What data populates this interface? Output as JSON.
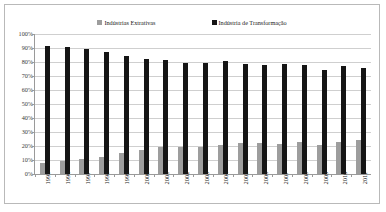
{
  "chart_data": {
    "type": "bar",
    "title": "",
    "subtitle": "",
    "xlabel": "",
    "ylabel": "",
    "ylim": [
      0,
      100
    ],
    "ytick_labels": [
      "100%",
      "90%",
      "80%",
      "70%",
      "60%",
      "50%",
      "40%",
      "30%",
      "20%",
      "10%",
      "0%"
    ],
    "ytick_values": [
      100,
      90,
      80,
      70,
      60,
      50,
      40,
      30,
      20,
      10,
      0
    ],
    "grid": true,
    "legend_position": "top",
    "categories": [
      "1995",
      "1996",
      "1997",
      "1998",
      "1999",
      "2000",
      "2001",
      "2002",
      "2003",
      "2004",
      "2005",
      "2006",
      "2007",
      "2008",
      "2009",
      "2010",
      "2011"
    ],
    "series": [
      {
        "name": "Indústrias Extrativas",
        "color": "#9d9d9d",
        "values": [
          8,
          9.5,
          11,
          12,
          15,
          17.5,
          19,
          19.5,
          19,
          21,
          22,
          22.5,
          21.5,
          23,
          21,
          23,
          24
        ]
      },
      {
        "name": "Indústria de Transformação",
        "color": "#151515",
        "values": [
          91.5,
          90.5,
          89,
          87,
          84.5,
          82.5,
          81.5,
          79.5,
          79.5,
          80.5,
          78.5,
          78,
          78.5,
          78,
          74.5,
          77,
          76
        ]
      }
    ]
  },
  "legend": {
    "entries": [
      {
        "label": "Indústrias Extrativas",
        "color": "#9d9d9d"
      },
      {
        "label": "Indústria de Transformação",
        "color": "#151515"
      }
    ]
  },
  "colors": {
    "extrativas": "#9d9d9d",
    "transformacao": "#151515",
    "gridline": "#cfcfcf",
    "axis": "#9a9a9a",
    "border": "#b9b9b9",
    "background": "#ffffff"
  }
}
